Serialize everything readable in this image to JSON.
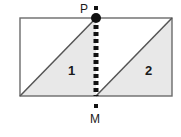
{
  "figure": {
    "type": "geometry-diagram",
    "canvas": {
      "width": 181,
      "height": 137,
      "background": "#ffffff"
    },
    "colors": {
      "outline": "#6b6b6b",
      "shade_fill": "#e8e8e8",
      "diagonal": "#555555",
      "dash": "#111111",
      "point": "#111111",
      "text": "#1a1a1a"
    },
    "rectangle": {
      "name": "outer-rectangle",
      "left": 20,
      "top": 18,
      "right": 172,
      "bottom": 96,
      "width": 152,
      "height": 78
    },
    "points": [
      {
        "id": "P",
        "label": "P",
        "x": 96,
        "y": 18,
        "marker": "filled-circle",
        "radius": 5,
        "label_position": "above-left"
      },
      {
        "id": "M",
        "label": "M",
        "x": 96,
        "y": 96,
        "marker": "small-square",
        "label_position": "below"
      }
    ],
    "segment": {
      "name": "PM",
      "style": "dashed",
      "from": "P",
      "to": "M",
      "x": 96,
      "y1": 18,
      "y2": 96,
      "stroke_width": 5,
      "dash_on": 4,
      "dash_off": 3
    },
    "regions": [
      {
        "id": "region-1",
        "label": "1",
        "shape": "right-triangle",
        "shaded": true,
        "vertices": [
          [
            20,
            96
          ],
          [
            96,
            18
          ],
          [
            96,
            96
          ]
        ],
        "label_x": 73,
        "label_y": 71
      },
      {
        "id": "region-2",
        "label": "2",
        "shape": "right-triangle",
        "shaded": true,
        "vertices": [
          [
            96,
            96
          ],
          [
            172,
            18
          ],
          [
            172,
            96
          ]
        ],
        "label_x": 150,
        "label_y": 71
      }
    ],
    "markers": {
      "p_tick": {
        "name": "p-tick-square",
        "x": 96,
        "y": 8,
        "size": 4
      },
      "m_tick": {
        "name": "m-tick-square",
        "x": 96,
        "y": 106,
        "size": 4
      }
    }
  }
}
